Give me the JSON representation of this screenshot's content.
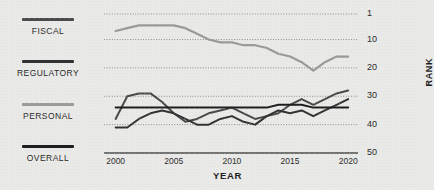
{
  "legend": {
    "items": [
      {
        "label": "FISCAL",
        "color": "#4a4a4a",
        "top": 18
      },
      {
        "label": "REGULATORY",
        "color": "#333333",
        "top": 60
      },
      {
        "label": "PERSONAL",
        "color": "#9a9a9a",
        "top": 103
      },
      {
        "label": "OVERALL",
        "color": "#1f1f1f",
        "top": 145
      }
    ]
  },
  "axes": {
    "y_title": "RANK",
    "x_title": "YEAR",
    "y_ticks": [
      "1",
      "10",
      "20",
      "30",
      "40",
      "50"
    ],
    "y_values": [
      1,
      10,
      20,
      30,
      40,
      50
    ],
    "x_ticks": [
      "2000",
      "2005",
      "2010",
      "2015",
      "2020"
    ],
    "x_values": [
      2000,
      2005,
      2010,
      2015,
      2020
    ]
  },
  "chart_data": {
    "type": "line",
    "title": "",
    "xlabel": "YEAR",
    "ylabel": "RANK",
    "xlim": [
      1999,
      2020.5
    ],
    "ylim": [
      1,
      50
    ],
    "y_inverted": true,
    "grid": "horizontal-dotted",
    "legend_position": "left",
    "x": [
      2000,
      2001,
      2002,
      2003,
      2004,
      2005,
      2006,
      2007,
      2008,
      2009,
      2010,
      2011,
      2012,
      2013,
      2014,
      2015,
      2016,
      2017,
      2018,
      2019,
      2020
    ],
    "series": [
      {
        "name": "PERSONAL",
        "color": "#9a9a9a",
        "values": [
          7,
          6,
          5,
          5,
          5,
          5,
          6,
          8,
          10,
          11,
          11,
          12,
          12,
          13,
          15,
          16,
          18,
          21,
          18,
          16,
          16
        ]
      },
      {
        "name": "FISCAL",
        "color": "#4a4a4a",
        "values": [
          38,
          30,
          29,
          29,
          32,
          36,
          39,
          38,
          36,
          35,
          34,
          36,
          38,
          37,
          36,
          33,
          31,
          33,
          31,
          29,
          28
        ]
      },
      {
        "name": "REGULATORY",
        "color": "#333333",
        "values": [
          41,
          41,
          38,
          36,
          35,
          36,
          38,
          40,
          40,
          38,
          37,
          39,
          40,
          37,
          35,
          36,
          35,
          37,
          35,
          33,
          31
        ]
      },
      {
        "name": "OVERALL",
        "color": "#1f1f1f",
        "values": [
          34,
          34,
          34,
          34,
          34,
          34,
          34,
          34,
          34,
          34,
          34,
          34,
          34,
          34,
          33,
          33,
          33,
          34,
          34,
          34,
          34
        ]
      }
    ]
  }
}
